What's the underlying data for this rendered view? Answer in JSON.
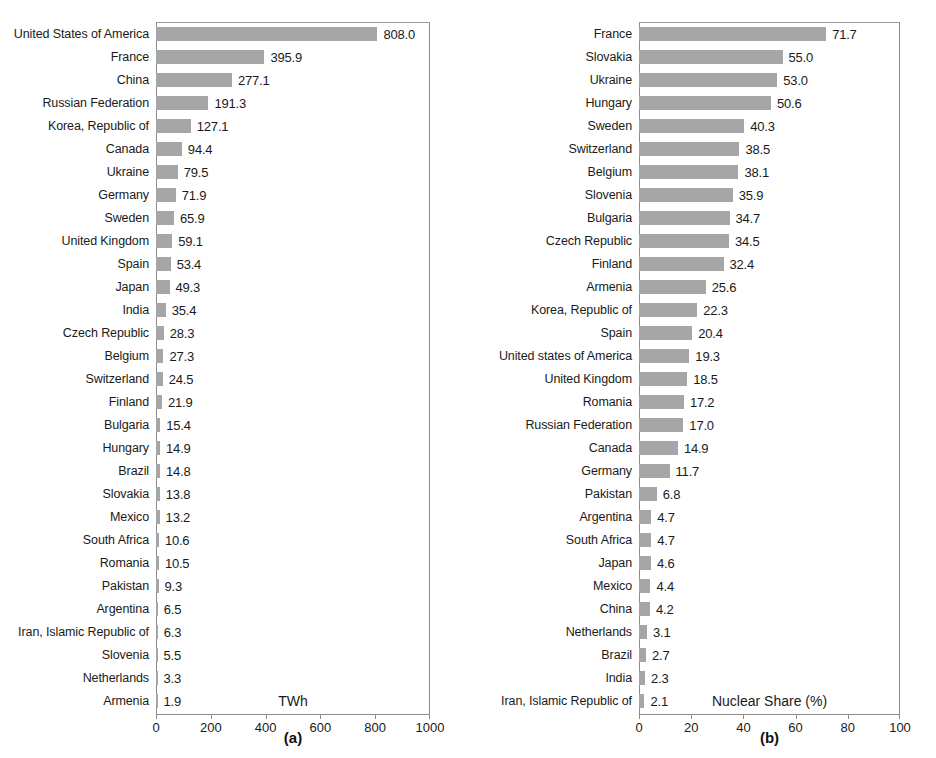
{
  "figure": {
    "background": "#ffffff",
    "bar_color": "#a6a6a6",
    "frame_color": "#8c8c8c",
    "text_color": "#1a1a1a"
  },
  "chart_data": [
    {
      "type": "bar",
      "orientation": "horizontal",
      "panel": "a",
      "caption": "(a)",
      "title": "",
      "xlabel": "TWh",
      "ylabel": "",
      "xlim": [
        0,
        1000
      ],
      "xticks": [
        0,
        200,
        400,
        600,
        800,
        1000
      ],
      "xtick_labels": [
        "0",
        "200",
        "400",
        "600",
        "800",
        "1000"
      ],
      "grid": false,
      "legend": null,
      "value_labels": true,
      "value_label_format": "one-decimal",
      "categories": [
        "United States of America",
        "France",
        "China",
        "Russian Federation",
        "Korea, Republic of",
        "Canada",
        "Ukraine",
        "Germany",
        "Sweden",
        "United Kingdom",
        "Spain",
        "Japan",
        "India",
        "Czech Republic",
        "Belgium",
        "Switzerland",
        "Finland",
        "Bulgaria",
        "Hungary",
        "Brazil",
        "Slovakia",
        "Mexico",
        "South Africa",
        "Romania",
        "Pakistan",
        "Argentina",
        "Iran, Islamic Republic of",
        "Slovenia",
        "Netherlands",
        "Armenia"
      ],
      "values": [
        808.0,
        395.9,
        277.1,
        191.3,
        127.1,
        94.4,
        79.5,
        71.9,
        65.9,
        59.1,
        53.4,
        49.3,
        35.4,
        28.3,
        27.3,
        24.5,
        21.9,
        15.4,
        14.9,
        14.8,
        13.8,
        13.2,
        10.6,
        10.5,
        9.3,
        6.5,
        6.3,
        5.5,
        3.3,
        1.9
      ],
      "labels": [
        "808.0",
        "395.9",
        "277.1",
        "191.3",
        "127.1",
        "94.4",
        "79.5",
        "71.9",
        "65.9",
        "59.1",
        "53.4",
        "49.3",
        "35.4",
        "28.3",
        "27.3",
        "24.5",
        "21.9",
        "15.4",
        "14.9",
        "14.8",
        "13.8",
        "13.2",
        "10.6",
        "10.5",
        "9.3",
        "6.5",
        "6.3",
        "5.5",
        "3.3",
        "1.9"
      ]
    },
    {
      "type": "bar",
      "orientation": "horizontal",
      "panel": "b",
      "caption": "(b)",
      "title": "",
      "xlabel": "Nuclear Share (%)",
      "ylabel": "",
      "xlim": [
        0,
        100
      ],
      "xticks": [
        0,
        20,
        40,
        60,
        80,
        100
      ],
      "xtick_labels": [
        "0",
        "20",
        "40",
        "60",
        "80",
        "100"
      ],
      "grid": false,
      "legend": null,
      "value_labels": true,
      "value_label_format": "one-decimal",
      "categories": [
        "France",
        "Slovakia",
        "Ukraine",
        "Hungary",
        "Sweden",
        "Switzerland",
        "Belgium",
        "Slovenia",
        "Bulgaria",
        "Czech Republic",
        "Finland",
        "Armenia",
        "Korea, Republic of",
        "Spain",
        "United states of America",
        "United Kingdom",
        "Romania",
        "Russian Federation",
        "Canada",
        "Germany",
        "Pakistan",
        "Argentina",
        "South Africa",
        "Japan",
        "Mexico",
        "China",
        "Netherlands",
        "Brazil",
        "India",
        "Iran, Islamic Republic of"
      ],
      "values": [
        71.7,
        55.0,
        53.0,
        50.6,
        40.3,
        38.5,
        38.1,
        35.9,
        34.7,
        34.5,
        32.4,
        25.6,
        22.3,
        20.4,
        19.3,
        18.5,
        17.2,
        17.0,
        14.9,
        11.7,
        6.8,
        4.7,
        4.7,
        4.6,
        4.4,
        4.2,
        3.1,
        2.7,
        2.3,
        2.1
      ],
      "labels": [
        "71.7",
        "55.0",
        "53.0",
        "50.6",
        "40.3",
        "38.5",
        "38.1",
        "35.9",
        "34.7",
        "34.5",
        "32.4",
        "25.6",
        "22.3",
        "20.4",
        "19.3",
        "18.5",
        "17.2",
        "17.0",
        "14.9",
        "11.7",
        "6.8",
        "4.7",
        "4.7",
        "4.6",
        "4.4",
        "4.2",
        "3.1",
        "2.7",
        "2.3",
        "2.1"
      ]
    }
  ]
}
